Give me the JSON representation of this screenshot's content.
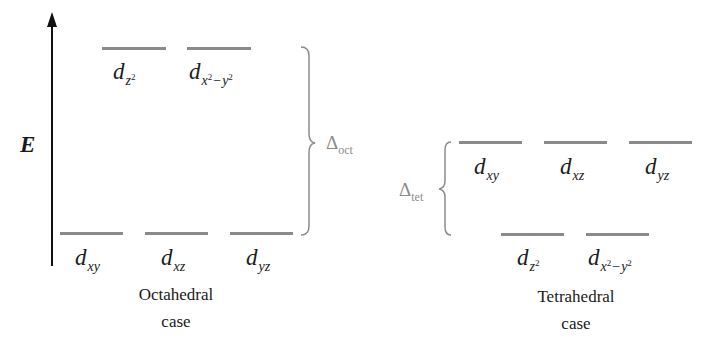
{
  "axis": {
    "label": "E"
  },
  "octahedral": {
    "caption_line1": "Octahedral",
    "caption_line2": "case",
    "splitting_label": {
      "symbol": "Δ",
      "subscript": "oct"
    },
    "upper": [
      {
        "d": "d",
        "sub": "z",
        "sup1": "2",
        "minus": "",
        "sub2": "",
        "sup2": ""
      },
      {
        "d": "d",
        "sub": "x",
        "sup1": "2",
        "minus": "−",
        "sub2": "y",
        "sup2": "2"
      }
    ],
    "lower": [
      {
        "d": "d",
        "sub": "xy"
      },
      {
        "d": "d",
        "sub": "xz"
      },
      {
        "d": "d",
        "sub": "yz"
      }
    ]
  },
  "tetrahedral": {
    "caption_line1": "Tetrahedral",
    "caption_line2": "case",
    "splitting_label": {
      "symbol": "Δ",
      "subscript": "tet"
    },
    "upper": [
      {
        "d": "d",
        "sub": "xy"
      },
      {
        "d": "d",
        "sub": "xz"
      },
      {
        "d": "d",
        "sub": "yz"
      }
    ],
    "lower": [
      {
        "d": "d",
        "sub": "z",
        "sup1": "2",
        "minus": "",
        "sub2": "",
        "sup2": ""
      },
      {
        "d": "d",
        "sub": "x",
        "sup1": "2",
        "minus": "−",
        "sub2": "y",
        "sup2": "2"
      }
    ]
  },
  "colors": {
    "level_line": "#8a8a8a",
    "brace": "#8c8c8c",
    "text": "#1a1a1a"
  }
}
